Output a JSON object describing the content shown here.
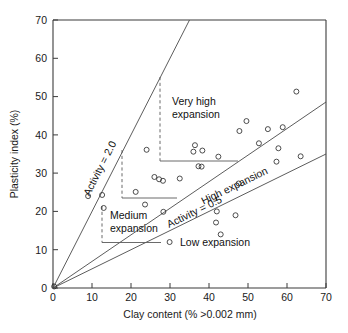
{
  "chart_data": {
    "type": "scatter",
    "title": "",
    "xlabel": "Clay content (% >0.002 mm)",
    "ylabel": "Plasticity index (%)",
    "xlim": [
      0,
      70
    ],
    "ylim": [
      0,
      70
    ],
    "xticks": [
      "0",
      "10",
      "20",
      "30",
      "40",
      "50",
      "60",
      "70"
    ],
    "yticks": [
      "0",
      "10",
      "20",
      "30",
      "40",
      "50",
      "60",
      "70"
    ],
    "xtick_values": [
      0,
      10,
      20,
      30,
      40,
      50,
      60,
      70
    ],
    "ytick_values": [
      0,
      10,
      20,
      30,
      40,
      50,
      60,
      70
    ],
    "grid": false,
    "legend": "none",
    "points": [
      [
        9.0,
        24.0
      ],
      [
        12.6,
        24.3
      ],
      [
        13.0,
        20.9
      ],
      [
        21.2,
        25.1
      ],
      [
        23.6,
        21.8
      ],
      [
        24.0,
        36.1
      ],
      [
        26.0,
        29.0
      ],
      [
        27.2,
        28.4
      ],
      [
        28.2,
        28.0
      ],
      [
        28.3,
        19.9
      ],
      [
        29.9,
        12.0
      ],
      [
        32.5,
        28.6
      ],
      [
        36.0,
        35.6
      ],
      [
        36.4,
        37.3
      ],
      [
        37.3,
        31.8
      ],
      [
        38.1,
        31.7
      ],
      [
        38.3,
        35.9
      ],
      [
        41.8,
        17.1
      ],
      [
        42.0,
        20.0
      ],
      [
        42.4,
        34.3
      ],
      [
        43.0,
        14.0
      ],
      [
        46.8,
        19.0
      ],
      [
        47.6,
        27.3
      ],
      [
        47.8,
        41.0
      ],
      [
        49.6,
        43.6
      ],
      [
        52.8,
        37.8
      ],
      [
        55.1,
        41.5
      ],
      [
        57.3,
        33.0
      ],
      [
        57.8,
        36.5
      ],
      [
        58.9,
        42.0
      ],
      [
        62.4,
        51.3
      ],
      [
        63.5,
        34.4
      ],
      [
        0.3,
        0.4
      ]
    ],
    "lines": [
      {
        "name": "activity-2.0",
        "slope": 2.0,
        "label": "Activity = 2.0"
      },
      {
        "name": "activity-0.85",
        "slope": 0.69,
        "label": ""
      },
      {
        "name": "activity-0.5",
        "slope": 0.5,
        "label": "Activity = 0.5"
      }
    ],
    "annotations": [
      {
        "name": "very-high-expansion",
        "text_line1": "Very high",
        "text_line2": "expansion"
      },
      {
        "name": "high-expansion",
        "text_line1": "High expansion",
        "text_line2": ""
      },
      {
        "name": "medium-expansion",
        "text_line1": "Medium",
        "text_line2": "expansion"
      },
      {
        "name": "low-expansion",
        "text_line1": "Low expansion",
        "text_line2": ""
      }
    ]
  },
  "axes": {
    "x_title": "Clay content (% >0.002 mm)",
    "y_title": "Plasticity index (%)",
    "x_ticks": [
      "0",
      "10",
      "20",
      "30",
      "40",
      "50",
      "60",
      "70"
    ],
    "y_ticks": [
      "0",
      "10",
      "20",
      "30",
      "40",
      "50",
      "60",
      "70"
    ]
  },
  "labels": {
    "activity_high": "Activity = 2.0",
    "activity_low": "Activity = 0.5",
    "very_high_1": "Very high",
    "very_high_2": "expansion",
    "high": "High expansion",
    "medium_1": "Medium",
    "medium_2": "expansion",
    "low": "Low expansion"
  },
  "colors": {
    "axis": "#3b3b3b",
    "point_stroke": "#2e2e2e",
    "zone_line": "#4a4a4a",
    "text": "#111111",
    "background": "#ffffff"
  }
}
